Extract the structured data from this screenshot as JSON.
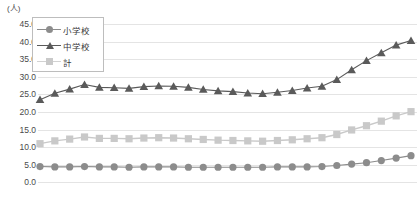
{
  "chart_data": {
    "type": "line",
    "title": "",
    "xlabel": "",
    "ylabel": "(人)",
    "unit_label": "(人)",
    "ylim": [
      0.0,
      45.0
    ],
    "ytick_labels": [
      "45.0",
      "40.0",
      "35.0",
      "30.0",
      "25.0",
      "20.0",
      "15.0",
      "10.0",
      "5.0",
      "0.0"
    ],
    "ytick_values": [
      45.0,
      40.0,
      35.0,
      30.0,
      25.0,
      20.0,
      15.0,
      10.0,
      5.0,
      0.0
    ],
    "grid": true,
    "legend_position": "top-left",
    "x": [
      1,
      2,
      3,
      4,
      5,
      6,
      7,
      8,
      9,
      10,
      11,
      12,
      13,
      14,
      15,
      16,
      17,
      18,
      19,
      20,
      21,
      22,
      23,
      24,
      25,
      26
    ],
    "series": [
      {
        "name": "小学校",
        "marker": "circle",
        "color": "#8c8c8c",
        "values": [
          4.5,
          4.4,
          4.4,
          4.5,
          4.4,
          4.4,
          4.3,
          4.4,
          4.4,
          4.4,
          4.3,
          4.3,
          4.3,
          4.3,
          4.3,
          4.3,
          4.4,
          4.4,
          4.4,
          4.5,
          4.8,
          5.2,
          5.6,
          6.2,
          6.9,
          7.6
        ]
      },
      {
        "name": "中学校",
        "marker": "triangle",
        "color": "#5a5a5a",
        "values": [
          23.5,
          25.3,
          26.5,
          27.8,
          27.0,
          26.9,
          26.7,
          27.2,
          27.4,
          27.3,
          27.0,
          26.4,
          26.0,
          25.8,
          25.4,
          25.2,
          25.6,
          26.1,
          26.8,
          27.3,
          29.2,
          32.0,
          34.6,
          36.8,
          39.0,
          40.3
        ]
      },
      {
        "name": "計",
        "marker": "square",
        "color": "#c9c9c9",
        "values": [
          11.0,
          11.8,
          12.3,
          12.9,
          12.5,
          12.5,
          12.4,
          12.6,
          12.7,
          12.6,
          12.4,
          12.2,
          12.0,
          11.9,
          11.8,
          11.7,
          11.9,
          12.1,
          12.4,
          12.7,
          13.6,
          14.9,
          16.1,
          17.4,
          18.9,
          20.1
        ]
      }
    ]
  },
  "legend": {
    "items": [
      {
        "label": "小学校"
      },
      {
        "label": "中学校"
      },
      {
        "label": "計"
      }
    ]
  }
}
